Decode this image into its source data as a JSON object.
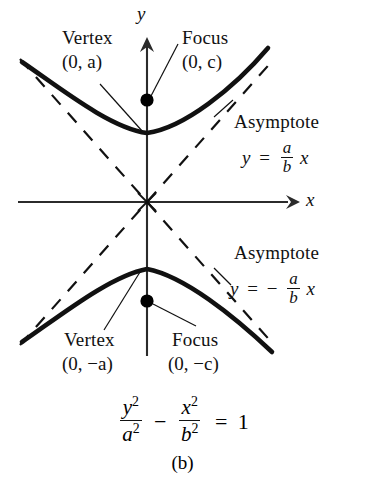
{
  "figure": {
    "caption": "(b)",
    "axes": {
      "x_label": "x",
      "y_label": "y"
    },
    "labels": {
      "vertex_top_name": "Vertex",
      "vertex_top_coord": "(0, a)",
      "focus_top_name": "Focus",
      "focus_top_coord": "(0, c)",
      "vertex_bottom_name": "Vertex",
      "vertex_bottom_coord": "(0, −a)",
      "focus_bottom_name": "Focus",
      "focus_bottom_coord": "(0, −c)",
      "asymptote_upper_name": "Asymptote",
      "asymptote_lower_name": "Asymptote"
    },
    "equations": {
      "asymptote_upper": {
        "lhs": "y",
        "rel": "=",
        "num": "a",
        "den": "b",
        "tail": "x",
        "sign": ""
      },
      "asymptote_lower": {
        "lhs": "y",
        "rel": "=",
        "num": "a",
        "den": "b",
        "tail": "x",
        "sign": "−"
      },
      "main": {
        "term1_num": "y",
        "term1_num_exp": "2",
        "term1_den": "a",
        "term1_den_exp": "2",
        "operator": "−",
        "term2_num": "x",
        "term2_num_exp": "2",
        "term2_den": "b",
        "term2_den_exp": "2",
        "rel": "=",
        "rhs": "1"
      }
    },
    "colors": {
      "curve": "#111111",
      "asymptote": "#111111",
      "axis": "#2b2b2b",
      "point": "#000000",
      "background": "#ffffff"
    },
    "geometry": {
      "origin_x": 147,
      "origin_y": 202,
      "focus_top": [
        147,
        100
      ],
      "focus_bottom": [
        147,
        301
      ],
      "vertex_top": [
        147,
        133
      ],
      "vertex_bottom": [
        147,
        269
      ]
    }
  }
}
